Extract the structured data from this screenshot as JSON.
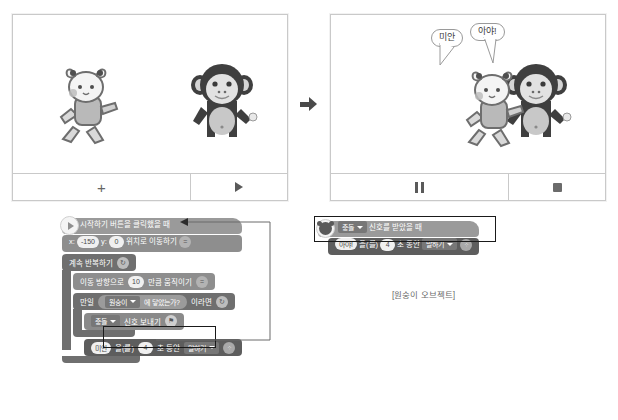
{
  "stages": {
    "before": {
      "name": "stage-before",
      "controls": [
        {
          "icon": "plus-icon",
          "label": "+"
        },
        {
          "icon": "play-icon",
          "label": ""
        }
      ],
      "sprites": [
        "cat-sprite",
        "monkey-sprite"
      ],
      "bubbles": []
    },
    "after": {
      "name": "stage-after",
      "controls": [
        {
          "icon": "pause-icon",
          "label": ""
        },
        {
          "icon": "stop-icon",
          "label": ""
        }
      ],
      "sprites": [
        "cat-sprite",
        "monkey-sprite"
      ],
      "bubbles": [
        {
          "name": "bubble-sorry",
          "text": "미안"
        },
        {
          "name": "bubble-ouch",
          "text": "아야!"
        }
      ]
    },
    "arrow_icon": "right-arrow-icon"
  },
  "scripts": {
    "left": {
      "title": "cat-object-script",
      "hat": {
        "icon": "start-flag-icon",
        "label": "시작하기 버튼을 클릭했을 때"
      },
      "move_to": {
        "x_label": "x:",
        "x_value": "-150",
        "y_label": "y:",
        "y_value": "0",
        "tail": "위치로 이동하기",
        "badge": "="
      },
      "repeat_forever": {
        "label": "계속 반복하기",
        "badge": "↻"
      },
      "move_step": {
        "prefix": "이동 방향으로",
        "value": "10",
        "suffix": "만큼 움직이기",
        "badge": "="
      },
      "if_block": {
        "prefix": "만일",
        "target": "원숭이",
        "condition": "에 닿았는가?",
        "suffix": "이라면",
        "badge": "↻"
      },
      "send_signal": {
        "signal": "충돌",
        "label": "신호 보내기",
        "badge": "⚑",
        "highlighted": true
      },
      "say_for_secs": {
        "message": "미안",
        "particle": "을(를)",
        "seconds": "4",
        "mid": "초 동안",
        "action": "말하기",
        "badge": "⁘"
      }
    },
    "right": {
      "title": "monkey-object-script",
      "hat": {
        "icon": "monkey-object-icon",
        "signal": "충돌",
        "label": "신호를 받았을 때",
        "highlighted": true
      },
      "say_for_secs": {
        "message": "아야!",
        "particle": "을(를)",
        "seconds": "4",
        "mid": "초 동안",
        "action": "말하기",
        "badge": "⁘"
      },
      "caption": "[원숭이 오브젝트]"
    }
  },
  "colors": {
    "start_block": "#9a9a9a",
    "move_block": "#8e8e8e",
    "flow_block": "#6f6f6f",
    "look_block": "#5d5d5d",
    "highlight_border": "#1a1a1a",
    "panel_border": "#c9c9c9"
  }
}
